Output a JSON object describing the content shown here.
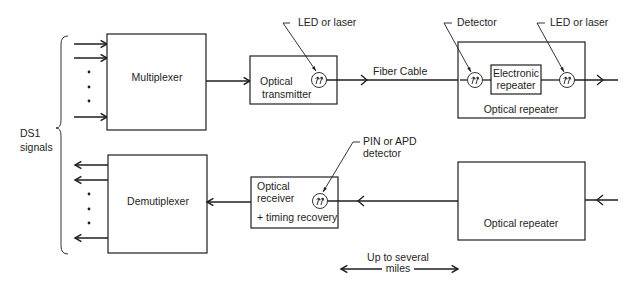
{
  "left_bracket_label": {
    "line1": "DS1",
    "line2": "signals"
  },
  "blocks": {
    "multiplexer": {
      "label": "Multiplexer"
    },
    "demultiplexer": {
      "label": "Demutiplexer"
    },
    "optical_transmitter": {
      "line1": "Optical",
      "line2": "transmitter"
    },
    "optical_receiver": {
      "line1": "Optical",
      "line2": "receiver",
      "line3": "+ timing recovery"
    },
    "optical_repeater_top": {
      "label": "Optical repeater"
    },
    "electronic_repeater": {
      "line1": "Electronic",
      "line2": "repeater"
    },
    "optical_repeater_bottom": {
      "label": "Optical repeater"
    }
  },
  "callouts": {
    "tx_led": "LED or laser",
    "detector": "Detector",
    "repeater_led": "LED or laser",
    "rx_detector_line1": "PIN or APD",
    "rx_detector_line2": "detector"
  },
  "links": {
    "fiber_cable": "Fiber Cable"
  },
  "distance": {
    "line1": "Up to several",
    "line2": "miles"
  },
  "colors": {
    "ink": "#1e1e1e",
    "background": "#ffffff"
  }
}
